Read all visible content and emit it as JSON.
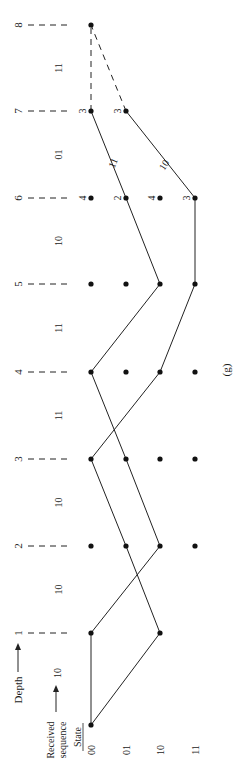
{
  "figure": {
    "caption": "(g)",
    "depth_label": "Depth",
    "received_label_line1": "Received",
    "received_label_line2": "sequence",
    "state_label": "State",
    "first_received": "10"
  },
  "states": [
    "00",
    "01",
    "10",
    "11"
  ],
  "depths": [
    "1",
    "2",
    "3",
    "4",
    "5",
    "6",
    "7",
    "8"
  ],
  "received_sequence": [
    "10",
    "10",
    "10",
    "11",
    "11",
    "10",
    "01",
    "11"
  ],
  "node_metrics": {
    "depth6": {
      "00": "4",
      "01": "2",
      "10": "4",
      "11": "3"
    },
    "depth7": {
      "00": "3",
      "01": "3"
    }
  },
  "branch_labels": {
    "d6_01_to_d7_00": "11",
    "d6_11_to_d7_01": "10"
  },
  "surviving_paths": [
    [
      "00",
      "00",
      "10",
      "01",
      "00",
      "10",
      "01",
      "00",
      "00"
    ],
    [
      "00",
      "10",
      "01",
      "00",
      "10",
      "11",
      "11",
      "01",
      "00"
    ]
  ]
}
